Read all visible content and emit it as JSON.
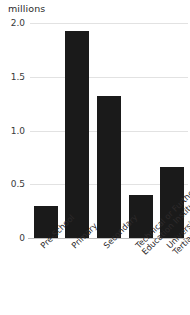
{
  "chart_data": {
    "type": "bar",
    "title": "",
    "subtitle": "",
    "xlabel": "",
    "ylabel": "millions",
    "unit_label": "millions",
    "categories": [
      "Pre-School",
      "Primary",
      "Secondary",
      "Technical or Further Education Institutes",
      "University or Other Tertiary Institutions"
    ],
    "category_lines": [
      [
        "Pre-School"
      ],
      [
        "Primary"
      ],
      [
        "Secondary"
      ],
      [
        "Technical or Further",
        "Education Institutes"
      ],
      [
        "University or Other",
        "Tertiary Institutions"
      ]
    ],
    "values": [
      0.3,
      1.93,
      1.32,
      0.4,
      0.66
    ],
    "ylim": [
      0,
      2.0
    ],
    "yticks": [
      0,
      0.5,
      1.0,
      1.5,
      2.0
    ],
    "ytick_labels": [
      "0",
      "0.5",
      "1.0",
      "1.5",
      "2.0"
    ],
    "grid": true,
    "legend": false,
    "legend_position": "none",
    "bar_color": "#1a1a1a",
    "grid_color": "#e2e2e2",
    "axis_color": "#bdbdbd",
    "background_color": "#ffffff",
    "label_rotation_degrees": -45
  }
}
